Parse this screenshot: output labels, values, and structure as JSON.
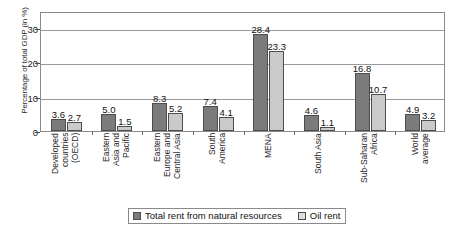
{
  "chart_data": {
    "type": "bar",
    "title": "",
    "xlabel": "",
    "ylabel": "Percentage of total GDP (in %)",
    "ylim": [
      0,
      35
    ],
    "yticks": [
      0,
      10,
      20,
      30
    ],
    "grid": true,
    "legend_position": "bottom",
    "categories": [
      "Developed countries (OECD)",
      "Eastern Asia and Pacific",
      "Eastern Europe and Central Asia",
      "South America",
      "MENA",
      "South Asia",
      "Sub-Saharan Africa",
      "World average"
    ],
    "category_lines": [
      [
        "Developed",
        "countries",
        "(OECD)"
      ],
      [
        "Eastern",
        "Asia and",
        "Pacific"
      ],
      [
        "Eastern",
        "Europe and",
        "Central Asia"
      ],
      [
        "South",
        "America"
      ],
      [
        "MENA"
      ],
      [
        "South Asia"
      ],
      [
        "Sub-Saharan",
        "Africa"
      ],
      [
        "World",
        "average"
      ]
    ],
    "series": [
      {
        "name": "Total rent from natural resources",
        "color": "#7b7b7b",
        "values": [
          3.6,
          5.0,
          8.3,
          7.4,
          28.4,
          4.6,
          16.8,
          4.9
        ]
      },
      {
        "name": "Oil rent",
        "color": "#cacaca",
        "values": [
          2.7,
          1.5,
          5.2,
          4.1,
          23.3,
          1.1,
          10.7,
          3.2
        ]
      }
    ]
  },
  "legend": {
    "items": [
      {
        "label": "Total rent from natural resources"
      },
      {
        "label": "Oil rent"
      }
    ]
  },
  "axis": {
    "y_title": "Percentage of total GDP (in %)",
    "y_tick_labels": [
      "0",
      "10",
      "20",
      "30"
    ]
  }
}
